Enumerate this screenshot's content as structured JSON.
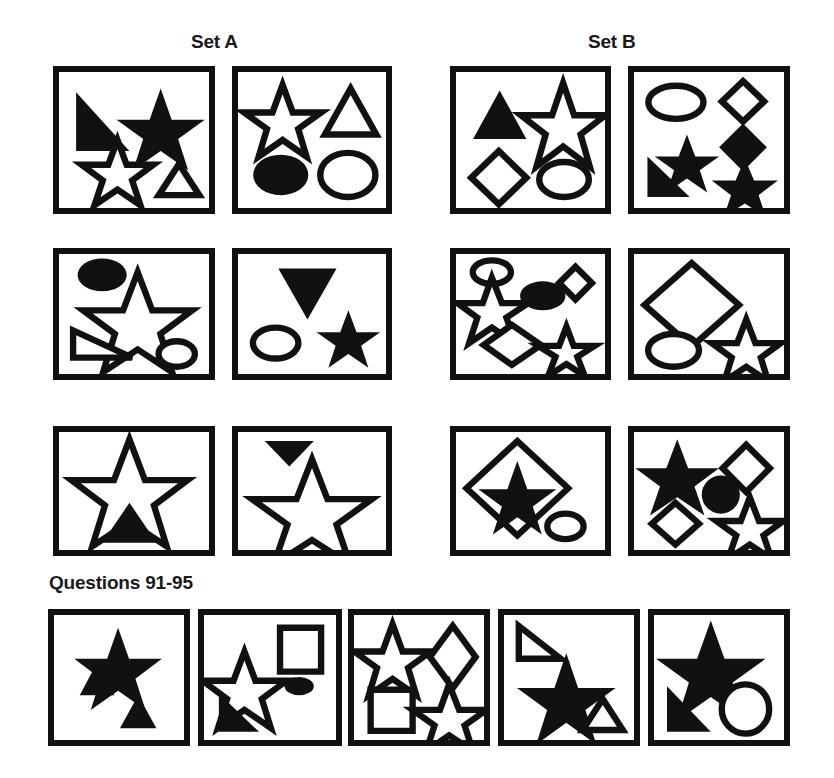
{
  "document": {
    "kind": "shape-analogy-test",
    "headings": {
      "set_a": "Set A",
      "set_b": "Set B",
      "questions": "Questions 91-95"
    },
    "colors": {
      "ink": "#111111",
      "paper": "#ffffff"
    }
  },
  "panels": {
    "set_a": [
      {
        "id": "a-r1-c1",
        "row": 1,
        "shapes": [
          {
            "type": "right-triangle",
            "fill": "filled",
            "note": "right angle top-left, hypotenuse down-right"
          },
          {
            "type": "star",
            "fill": "filled",
            "size": "medium"
          },
          {
            "type": "star",
            "fill": "outline",
            "size": "medium"
          },
          {
            "type": "triangle",
            "fill": "outline",
            "size": "small"
          }
        ]
      },
      {
        "id": "a-r1-c2",
        "row": 1,
        "shapes": [
          {
            "type": "star",
            "fill": "outline",
            "size": "medium"
          },
          {
            "type": "triangle",
            "fill": "outline",
            "size": "medium"
          },
          {
            "type": "ellipse",
            "fill": "filled",
            "size": "medium"
          },
          {
            "type": "ellipse",
            "fill": "outline",
            "size": "medium"
          }
        ]
      },
      {
        "id": "a-r2-c1",
        "row": 2,
        "shapes": [
          {
            "type": "ellipse",
            "fill": "filled",
            "size": "small"
          },
          {
            "type": "star",
            "fill": "outline",
            "size": "large"
          },
          {
            "type": "right-triangle",
            "fill": "outline",
            "note": "right angle top-left"
          },
          {
            "type": "ellipse",
            "fill": "outline",
            "size": "small"
          }
        ]
      },
      {
        "id": "a-r2-c2",
        "row": 2,
        "shapes": [
          {
            "type": "triangle-down",
            "fill": "filled",
            "size": "medium"
          },
          {
            "type": "ellipse",
            "fill": "outline",
            "size": "small"
          },
          {
            "type": "star",
            "fill": "filled",
            "size": "small"
          }
        ]
      },
      {
        "id": "a-r3-c1",
        "row": 3,
        "shapes": [
          {
            "type": "star",
            "fill": "outline",
            "size": "large"
          },
          {
            "type": "triangle",
            "fill": "filled",
            "size": "medium"
          }
        ]
      },
      {
        "id": "a-r3-c2",
        "row": 3,
        "shapes": [
          {
            "type": "triangle-down",
            "fill": "filled",
            "size": "small-wide"
          },
          {
            "type": "star",
            "fill": "outline",
            "size": "large"
          }
        ]
      }
    ],
    "set_b": [
      {
        "id": "b-r1-c1",
        "row": 1,
        "shapes": [
          {
            "type": "triangle",
            "fill": "filled",
            "size": "medium"
          },
          {
            "type": "star",
            "fill": "outline",
            "size": "medium"
          },
          {
            "type": "diamond",
            "fill": "outline",
            "size": "medium"
          },
          {
            "type": "ellipse",
            "fill": "outline",
            "size": "small"
          }
        ]
      },
      {
        "id": "b-r1-c2",
        "row": 1,
        "shapes": [
          {
            "type": "ellipse",
            "fill": "outline",
            "size": "medium"
          },
          {
            "type": "diamond",
            "fill": "outline",
            "size": "small"
          },
          {
            "type": "diamond",
            "fill": "filled",
            "size": "medium"
          },
          {
            "type": "star",
            "fill": "filled",
            "size": "small"
          },
          {
            "type": "right-triangle",
            "fill": "filled",
            "note": "right angle top-left"
          },
          {
            "type": "star",
            "fill": "filled",
            "size": "medium"
          }
        ]
      },
      {
        "id": "b-r2-c1",
        "row": 2,
        "shapes": [
          {
            "type": "ellipse",
            "fill": "outline",
            "size": "small"
          },
          {
            "type": "star",
            "fill": "outline",
            "size": "medium"
          },
          {
            "type": "ellipse",
            "fill": "filled",
            "size": "small"
          },
          {
            "type": "diamond",
            "fill": "outline",
            "size": "x-small"
          },
          {
            "type": "diamond",
            "fill": "outline",
            "size": "medium"
          },
          {
            "type": "star",
            "fill": "outline",
            "size": "small"
          }
        ]
      },
      {
        "id": "b-r2-c2",
        "row": 2,
        "shapes": [
          {
            "type": "diamond",
            "fill": "outline",
            "size": "large"
          },
          {
            "type": "ellipse",
            "fill": "outline",
            "size": "medium"
          },
          {
            "type": "star",
            "fill": "outline",
            "size": "medium"
          }
        ]
      },
      {
        "id": "b-r3-c1",
        "row": 3,
        "shapes": [
          {
            "type": "diamond",
            "fill": "outline",
            "size": "large"
          },
          {
            "type": "star",
            "fill": "filled",
            "size": "medium",
            "note": "inside diamond"
          },
          {
            "type": "ellipse",
            "fill": "outline",
            "size": "small"
          }
        ]
      },
      {
        "id": "b-r3-c2",
        "row": 3,
        "shapes": [
          {
            "type": "star",
            "fill": "filled",
            "size": "medium"
          },
          {
            "type": "diamond",
            "fill": "outline",
            "size": "small"
          },
          {
            "type": "circle",
            "fill": "filled",
            "size": "small"
          },
          {
            "type": "diamond",
            "fill": "outline",
            "size": "small"
          },
          {
            "type": "star",
            "fill": "outline",
            "size": "medium"
          }
        ]
      }
    ],
    "questions": [
      {
        "id": "q91",
        "number": 91,
        "shapes": [
          {
            "type": "star",
            "fill": "filled",
            "size": "medium"
          },
          {
            "type": "triangle",
            "fill": "filled",
            "size": "small"
          },
          {
            "type": "triangle",
            "fill": "filled",
            "size": "small"
          }
        ]
      },
      {
        "id": "q92",
        "number": 92,
        "shapes": [
          {
            "type": "star",
            "fill": "outline",
            "size": "medium"
          },
          {
            "type": "square",
            "fill": "outline",
            "size": "medium"
          },
          {
            "type": "ellipse",
            "fill": "filled",
            "size": "x-small"
          },
          {
            "type": "right-triangle",
            "fill": "filled",
            "note": "right angle top-left"
          }
        ]
      },
      {
        "id": "q93",
        "number": 93,
        "shapes": [
          {
            "type": "star",
            "fill": "outline",
            "size": "medium"
          },
          {
            "type": "diamond",
            "fill": "outline",
            "size": "medium"
          },
          {
            "type": "square",
            "fill": "outline",
            "size": "medium"
          },
          {
            "type": "star",
            "fill": "outline",
            "size": "medium"
          }
        ]
      },
      {
        "id": "q94",
        "number": 94,
        "shapes": [
          {
            "type": "right-triangle",
            "fill": "outline",
            "note": "right angle top-left"
          },
          {
            "type": "star",
            "fill": "filled",
            "size": "medium"
          },
          {
            "type": "triangle",
            "fill": "outline",
            "size": "small"
          }
        ]
      },
      {
        "id": "q95",
        "number": 95,
        "shapes": [
          {
            "type": "star",
            "fill": "filled",
            "size": "large"
          },
          {
            "type": "right-triangle",
            "fill": "filled",
            "note": "right angle top-left"
          },
          {
            "type": "ellipse",
            "fill": "outline",
            "size": "medium"
          }
        ]
      }
    ]
  }
}
